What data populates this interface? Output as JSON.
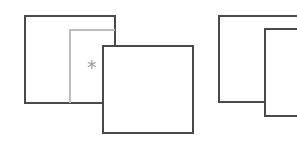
{
  "diagram": {
    "left_group": {
      "back_window": {
        "x": 24,
        "y": 15,
        "w": 92,
        "h": 89,
        "stroke": "#4a4a4a"
      },
      "inner_panel": {
        "x": 69,
        "y": 29,
        "stroke": "#bdbdbd"
      },
      "marker": {
        "symbol": "*",
        "color": "#9a9a9a"
      },
      "front_window": {
        "x": 102,
        "y": 45,
        "w": 92,
        "h": 89,
        "stroke": "#4a4a4a"
      }
    },
    "right_group": {
      "back_window": {
        "x": 218,
        "y": 15,
        "stroke": "#4a4a4a"
      },
      "front_window": {
        "x": 264,
        "y": 28,
        "stroke": "#4a4a4a"
      }
    }
  }
}
